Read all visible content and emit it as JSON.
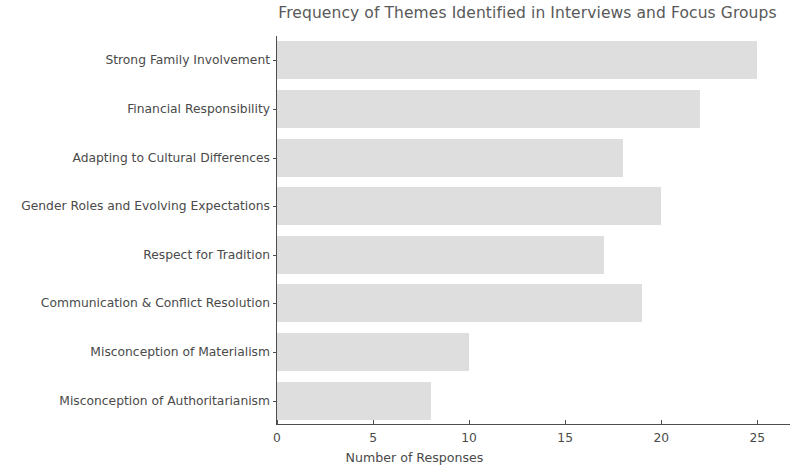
{
  "chart_data": {
    "type": "bar",
    "orientation": "horizontal",
    "title": "Frequency of Themes Identified in Interviews and Focus Groups",
    "xlabel": "Number of Responses",
    "ylabel": "",
    "categories": [
      "Strong Family Involvement",
      "Financial Responsibility",
      "Adapting to Cultural Differences",
      "Gender Roles and Evolving Expectations",
      "Respect for Tradition",
      "Communication & Conflict Resolution",
      "Misconception of Materialism",
      "Misconception of Authoritarianism"
    ],
    "values": [
      25,
      22,
      18,
      20,
      17,
      19,
      10,
      8
    ],
    "xticks": [
      0,
      5,
      10,
      15,
      20,
      25
    ],
    "xtick_labels": [
      "0",
      "5",
      "10",
      "15",
      "20",
      "25"
    ],
    "xlim": [
      0,
      26.7
    ],
    "grid": false,
    "legend": null,
    "bar_color": "#dedede",
    "axis_color": "#4d4d4d",
    "text_color": "#4a4a4a",
    "title_color": "#595959",
    "background_color": "#ffffff"
  }
}
